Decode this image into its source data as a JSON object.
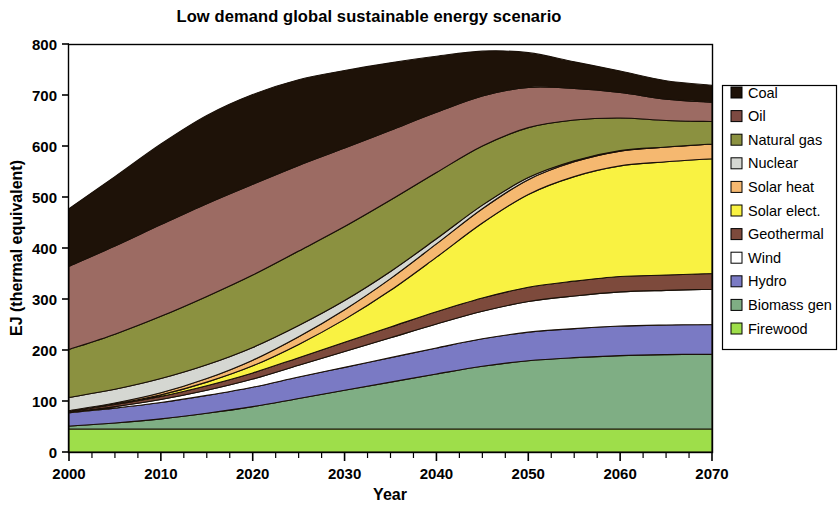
{
  "chart_data": {
    "type": "area",
    "stacked": true,
    "title": "Low demand global sustainable energy scenario",
    "xlabel": "Year",
    "ylabel": "EJ (thermal equivalent)",
    "xlim": [
      2000,
      2070
    ],
    "ylim": [
      0,
      800
    ],
    "xticks": [
      2000,
      2010,
      2020,
      2030,
      2040,
      2050,
      2060,
      2070
    ],
    "xtick_labels": [
      "2000",
      "2010",
      "2020",
      "2030",
      "2040",
      "2050",
      "2060",
      "2070"
    ],
    "yticks": [
      0,
      100,
      200,
      300,
      400,
      500,
      600,
      700,
      800
    ],
    "ytick_labels": [
      "0",
      "100",
      "200",
      "300",
      "400",
      "500",
      "600",
      "700",
      "800"
    ],
    "minor_xtick_step": 2.5,
    "grid": false,
    "legend_position": "right",
    "x": [
      2000,
      2005,
      2010,
      2015,
      2020,
      2025,
      2030,
      2035,
      2040,
      2045,
      2050,
      2055,
      2060,
      2065,
      2070
    ],
    "series": [
      {
        "name": "Firewood",
        "color": "#9ede4a",
        "values": [
          45,
          45,
          45,
          45,
          45,
          45,
          45,
          45,
          45,
          45,
          45,
          45,
          45,
          45,
          45
        ]
      },
      {
        "name": "Biomass gen",
        "color": "#7fae84",
        "values": [
          6,
          12,
          20,
          31,
          44,
          60,
          76,
          92,
          108,
          123,
          134,
          140,
          144,
          146,
          147
        ]
      },
      {
        "name": "Hydro",
        "color": "#7a7ac4",
        "values": [
          26,
          29,
          32,
          35,
          38,
          42,
          45,
          48,
          51,
          54,
          56,
          57,
          58,
          58,
          58
        ]
      },
      {
        "name": "Wind",
        "color": "#ffffff",
        "values": [
          1,
          3,
          6,
          10,
          16,
          23,
          31,
          39,
          47,
          54,
          60,
          64,
          67,
          68,
          69
        ]
      },
      {
        "name": "Geothermal",
        "color": "#7d4a3c",
        "values": [
          2,
          4,
          6,
          9,
          12,
          15,
          18,
          21,
          24,
          26,
          28,
          29,
          30,
          30,
          31
        ]
      },
      {
        "name": "Solar elect.",
        "color": "#f9f242",
        "values": [
          0,
          1,
          3,
          7,
          14,
          26,
          45,
          72,
          107,
          147,
          182,
          205,
          217,
          222,
          225
        ]
      },
      {
        "name": "Solar heat",
        "color": "#f5b870",
        "values": [
          1,
          2,
          4,
          7,
          11,
          15,
          19,
          23,
          26,
          28,
          29,
          29,
          29,
          29,
          29
        ]
      },
      {
        "name": "Nuclear",
        "color": "#d5d7d2",
        "values": [
          26,
          27,
          28,
          27,
          25,
          22,
          18,
          14,
          10,
          7,
          4,
          2,
          1,
          0,
          0
        ]
      },
      {
        "name": "Natural gas",
        "color": "#8b9140",
        "values": [
          94,
          108,
          122,
          134,
          142,
          146,
          145,
          140,
          130,
          116,
          98,
          80,
          64,
          52,
          44
        ]
      },
      {
        "name": "Oil",
        "color": "#9c6b63",
        "values": [
          163,
          173,
          180,
          182,
          178,
          168,
          154,
          137,
          118,
          98,
          79,
          62,
          50,
          42,
          38
        ]
      },
      {
        "name": "Coal",
        "color": "#1e1208",
        "values": [
          113,
          136,
          158,
          173,
          176,
          168,
          152,
          132,
          110,
          88,
          68,
          52,
          42,
          36,
          33
        ]
      }
    ],
    "totals": [
      477,
      540,
      604,
      660,
      691,
      730,
      748,
      763,
      776,
      786,
      783,
      765,
      747,
      728,
      719
    ],
    "legend_order": [
      "Coal",
      "Oil",
      "Natural gas",
      "Nuclear",
      "Solar heat",
      "Solar elect.",
      "Geothermal",
      "Wind",
      "Hydro",
      "Biomass gen",
      "Firewood"
    ]
  },
  "legend": {
    "items": [
      {
        "label": "Coal",
        "color": "#1e1208"
      },
      {
        "label": "Oil",
        "color": "#7d4a42"
      },
      {
        "label": "Natural gas",
        "color": "#8b9140"
      },
      {
        "label": "Nuclear",
        "color": "#d5d7d2"
      },
      {
        "label": "Solar heat",
        "color": "#f5b870"
      },
      {
        "label": "Solar elect.",
        "color": "#f9f242"
      },
      {
        "label": "Geothermal",
        "color": "#7d4a3c"
      },
      {
        "label": "Wind",
        "color": "#ffffff"
      },
      {
        "label": "Hydro",
        "color": "#7a7ac4"
      },
      {
        "label": "Biomass gen",
        "color": "#7fae84"
      },
      {
        "label": "Firewood",
        "color": "#9ede4a"
      }
    ]
  },
  "colors": {
    "axis": "#000000",
    "background": "#ffffff",
    "band_outline": "#1a1008"
  }
}
